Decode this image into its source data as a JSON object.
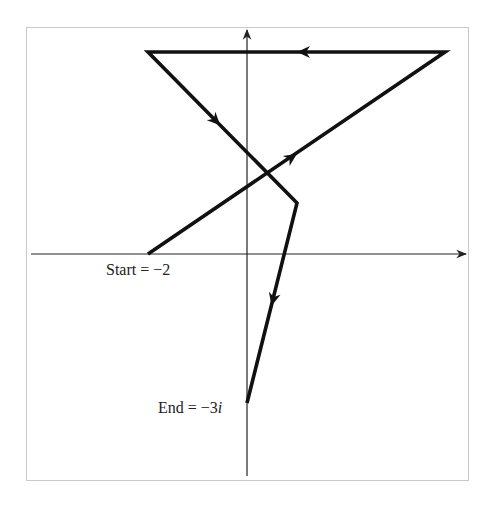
{
  "diagram": {
    "type": "complex-plane-path",
    "start_label": "Start = −2",
    "end_label_prefix": "End = −3",
    "end_label_unit": "i",
    "colors": {
      "path": "#111111",
      "axes": "#222222",
      "frame": "#c8c8c8",
      "background": "#ffffff"
    },
    "vertices_px": [
      {
        "name": "start",
        "x": 148,
        "y": 254
      },
      {
        "name": "top-right",
        "x": 445,
        "y": 52
      },
      {
        "name": "top-left",
        "x": 148,
        "y": 52
      },
      {
        "name": "middle-right",
        "x": 297,
        "y": 203
      },
      {
        "name": "end",
        "x": 247,
        "y": 403
      }
    ],
    "axes": {
      "origin_px": {
        "x": 247,
        "y": 254
      },
      "x_axis": {
        "from": 31,
        "to": 467
      },
      "y_axis": {
        "from": 476,
        "to": 29
      }
    }
  }
}
